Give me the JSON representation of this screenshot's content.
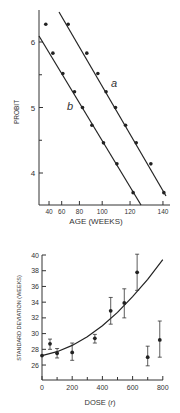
{
  "chart_data": [
    {
      "type": "scatter",
      "title": "",
      "xlabel": "AGE (WEEKS)",
      "ylabel": "PROBIT",
      "x_scale": "square",
      "x_ticks": [
        40,
        60,
        80,
        100,
        120,
        140
      ],
      "y_ticks": [
        4,
        5,
        6
      ],
      "ylim": [
        3.55,
        6.5
      ],
      "grid": false,
      "series": [
        {
          "name": "a",
          "with_fit_line": true,
          "x": [
            68,
            87,
            96.5,
            103,
            110,
            117,
            124,
            133,
            140.5
          ],
          "y": [
            6.27,
            5.83,
            5.52,
            5.24,
            5.0,
            4.73,
            4.46,
            4.14,
            3.7
          ]
        },
        {
          "name": "b",
          "with_fit_line": true,
          "x": [
            33,
            47,
            61.5,
            75,
            83,
            91.5,
            101,
            111,
            122
          ],
          "y": [
            6.27,
            5.83,
            5.52,
            5.24,
            5.0,
            4.73,
            4.46,
            4.14,
            3.7
          ]
        }
      ]
    },
    {
      "type": "scatter",
      "title": "",
      "xlabel": "DOSE (r)",
      "ylabel": "STANDARD DEVIATION (WEEKS)",
      "x_ticks": [
        0,
        200,
        400,
        600,
        800
      ],
      "x_minor_ticks": [
        100,
        300,
        500,
        700
      ],
      "y_ticks": [
        26,
        28,
        30,
        32,
        34,
        36,
        38,
        40
      ],
      "xlim": [
        0,
        800
      ],
      "ylim": [
        24.2,
        40
      ],
      "grid": false,
      "points": [
        {
          "x": 0,
          "y": 27.2,
          "err_low": 27.2,
          "err_high": 27.2
        },
        {
          "x": 53,
          "y": 28.7,
          "err_low": 28.0,
          "err_high": 29.3
        },
        {
          "x": 100,
          "y": 27.5,
          "err_low": 26.9,
          "err_high": 28.1
        },
        {
          "x": 200,
          "y": 27.6,
          "err_low": 26.6,
          "err_high": 28.8
        },
        {
          "x": 350,
          "y": 29.4,
          "err_low": 28.8,
          "err_high": 29.9
        },
        {
          "x": 455,
          "y": 32.9,
          "err_low": 31.2,
          "err_high": 34.6
        },
        {
          "x": 545,
          "y": 33.9,
          "err_low": 32.0,
          "err_high": 35.7
        },
        {
          "x": 630,
          "y": 37.8,
          "err_low": 35.5,
          "err_high": 40.1
        },
        {
          "x": 700,
          "y": 27.0,
          "err_low": 25.9,
          "err_high": 28.4
        },
        {
          "x": 780,
          "y": 29.2,
          "err_low": 27.0,
          "err_high": 31.6
        }
      ],
      "fit_curve": {
        "x": [
          0,
          100,
          200,
          300,
          400,
          500,
          600,
          700,
          800
        ],
        "y": [
          27.2,
          27.7,
          28.5,
          29.6,
          31.0,
          32.7,
          34.7,
          36.9,
          39.4
        ]
      }
    }
  ],
  "labels": {
    "top_x": "AGE (WEEKS)",
    "top_y": "PROBIT",
    "bottom_x": "DOSE (",
    "bottom_x_r": "r",
    "bottom_x_end": ")",
    "bottom_y": "STANDARD DEVIATION (WEEKS)",
    "series_a": "a",
    "series_b": "b"
  }
}
